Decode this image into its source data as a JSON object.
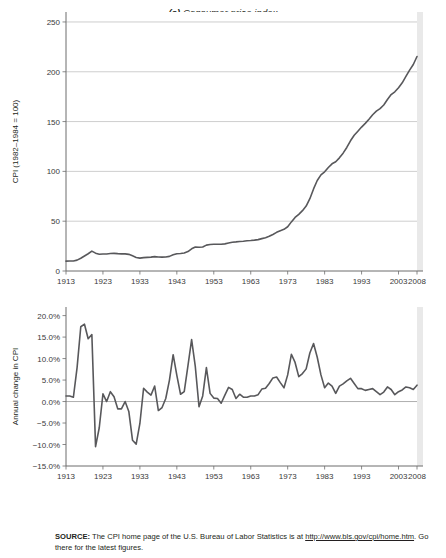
{
  "figure": {
    "panel_a_title_prefix": "(a)",
    "panel_a_title": " Consumer price index",
    "panel_b_title_prefix": "(b)",
    "panel_b_title": " Annual percentage change"
  },
  "source": {
    "label": "SOURCE:",
    "text_before": " The CPI home page of the U.S. Bureau of Labor Statistics is at ",
    "url": "http://www.bls.gov/cpi/home.htm",
    "text_after": ". Go there for the latest figures."
  },
  "colors": {
    "line": "#58585b",
    "grid": "#b9b9b9",
    "axis": "#6d6d6d",
    "text": "#231f20",
    "plot_bg": "#ffffff"
  },
  "chart_data": [
    {
      "type": "line",
      "id": "consumer-price-index",
      "title": "(a) Consumer price index",
      "xlabel": "",
      "ylabel": "CPI (1982–1984 = 100)",
      "ylim": [
        0,
        260
      ],
      "xlim": [
        1913,
        2008
      ],
      "yticks": [
        0,
        50,
        100,
        150,
        200,
        250
      ],
      "ytick_labels": [
        "0",
        "50",
        "100",
        "150",
        "200",
        "250"
      ],
      "xticks": [
        1913,
        1923,
        1933,
        1943,
        1953,
        1963,
        1973,
        1983,
        1993,
        2003,
        2008
      ],
      "xtick_labels": [
        "1913",
        "1923",
        "1933",
        "1943",
        "1953",
        "1963",
        "1973",
        "1983",
        "1993",
        "2003",
        "2008"
      ],
      "grid": "horizontal",
      "legend": "none",
      "x": [
        1913,
        1914,
        1915,
        1916,
        1917,
        1918,
        1919,
        1920,
        1921,
        1922,
        1923,
        1924,
        1925,
        1926,
        1927,
        1928,
        1929,
        1930,
        1931,
        1932,
        1933,
        1934,
        1935,
        1936,
        1937,
        1938,
        1939,
        1940,
        1941,
        1942,
        1943,
        1944,
        1945,
        1946,
        1947,
        1948,
        1949,
        1950,
        1951,
        1952,
        1953,
        1954,
        1955,
        1956,
        1957,
        1958,
        1959,
        1960,
        1961,
        1962,
        1963,
        1964,
        1965,
        1966,
        1967,
        1968,
        1969,
        1970,
        1971,
        1972,
        1973,
        1974,
        1975,
        1976,
        1977,
        1978,
        1979,
        1980,
        1981,
        1982,
        1983,
        1984,
        1985,
        1986,
        1987,
        1988,
        1989,
        1990,
        1991,
        1992,
        1993,
        1994,
        1995,
        1996,
        1997,
        1998,
        1999,
        2000,
        2001,
        2002,
        2003,
        2004,
        2005,
        2006,
        2007,
        2008
      ],
      "values": [
        9.9,
        10.0,
        10.1,
        10.9,
        12.8,
        15.1,
        17.3,
        20.0,
        17.9,
        16.8,
        17.1,
        17.1,
        17.5,
        17.7,
        17.4,
        17.2,
        17.2,
        16.7,
        15.2,
        13.6,
        12.9,
        13.4,
        13.7,
        13.9,
        14.4,
        14.1,
        13.9,
        14.0,
        14.7,
        16.3,
        17.3,
        17.6,
        18.0,
        19.5,
        22.3,
        24.0,
        23.8,
        24.1,
        26.0,
        26.6,
        26.8,
        26.9,
        26.8,
        27.2,
        28.1,
        28.9,
        29.2,
        29.6,
        29.9,
        30.3,
        30.6,
        31.0,
        31.5,
        32.5,
        33.4,
        34.8,
        36.7,
        38.8,
        40.5,
        41.8,
        44.4,
        49.3,
        53.8,
        56.9,
        60.6,
        65.2,
        72.6,
        82.4,
        90.9,
        96.5,
        99.6,
        103.9,
        107.6,
        109.6,
        113.6,
        118.3,
        124.0,
        130.7,
        136.2,
        140.3,
        144.5,
        148.2,
        152.4,
        156.9,
        160.5,
        163.0,
        166.6,
        172.2,
        177.1,
        179.9,
        184.0,
        188.9,
        195.3,
        201.6,
        207.3,
        215.3
      ]
    },
    {
      "type": "line",
      "id": "annual-percentage-change",
      "title": "(b) Annual percentage change",
      "xlabel": "",
      "ylabel": "Annual change in CPI",
      "ylim": [
        -15,
        22
      ],
      "xlim": [
        1913,
        2008
      ],
      "yticks": [
        20,
        15,
        10,
        5,
        0,
        -5,
        -10,
        -15
      ],
      "ytick_labels": [
        "20.0%",
        "15.0%",
        "10.0%",
        "5.0%",
        "0.0%",
        "−5.0%",
        "−10.0%",
        "−15.0%"
      ],
      "xticks": [
        1913,
        1923,
        1933,
        1943,
        1953,
        1963,
        1973,
        1983,
        1993,
        2003,
        2008
      ],
      "xtick_labels": [
        "1913",
        "1923",
        "1933",
        "1943",
        "1953",
        "1963",
        "1973",
        "1983",
        "1993",
        "2003",
        "2008"
      ],
      "grid": "zero-only",
      "legend": "none",
      "x": [
        1913,
        1914,
        1915,
        1916,
        1917,
        1918,
        1919,
        1920,
        1921,
        1922,
        1923,
        1924,
        1925,
        1926,
        1927,
        1928,
        1929,
        1930,
        1931,
        1932,
        1933,
        1934,
        1935,
        1936,
        1937,
        1938,
        1939,
        1940,
        1941,
        1942,
        1943,
        1944,
        1945,
        1946,
        1947,
        1948,
        1949,
        1950,
        1951,
        1952,
        1953,
        1954,
        1955,
        1956,
        1957,
        1958,
        1959,
        1960,
        1961,
        1962,
        1963,
        1964,
        1965,
        1966,
        1967,
        1968,
        1969,
        1970,
        1971,
        1972,
        1973,
        1974,
        1975,
        1976,
        1977,
        1978,
        1979,
        1980,
        1981,
        1982,
        1983,
        1984,
        1985,
        1986,
        1987,
        1988,
        1989,
        1990,
        1991,
        1992,
        1993,
        1994,
        1995,
        1996,
        1997,
        1998,
        1999,
        2000,
        2001,
        2002,
        2003,
        2004,
        2005,
        2006,
        2007,
        2008
      ],
      "values": [
        1.3,
        1.3,
        1.0,
        7.9,
        17.4,
        18.0,
        14.6,
        15.6,
        -10.5,
        -6.1,
        1.8,
        0.0,
        2.3,
        1.1,
        -1.7,
        -1.7,
        0.0,
        -2.3,
        -9.0,
        -9.9,
        -5.1,
        3.1,
        2.2,
        1.5,
        3.6,
        -2.1,
        -1.4,
        0.7,
        5.0,
        10.9,
        6.1,
        1.7,
        2.3,
        8.3,
        14.4,
        8.1,
        -1.2,
        1.3,
        7.9,
        1.9,
        0.8,
        0.7,
        -0.4,
        1.5,
        3.3,
        2.8,
        0.7,
        1.7,
        1.0,
        1.0,
        1.3,
        1.3,
        1.6,
        2.9,
        3.1,
        4.2,
        5.5,
        5.7,
        4.4,
        3.2,
        6.2,
        11.0,
        9.1,
        5.8,
        6.5,
        7.6,
        11.3,
        13.5,
        10.3,
        6.2,
        3.2,
        4.3,
        3.6,
        1.9,
        3.6,
        4.1,
        4.8,
        5.4,
        4.2,
        3.0,
        3.0,
        2.6,
        2.8,
        3.0,
        2.3,
        1.6,
        2.2,
        3.4,
        2.8,
        1.6,
        2.3,
        2.7,
        3.4,
        3.2,
        2.8,
        3.8
      ]
    }
  ]
}
